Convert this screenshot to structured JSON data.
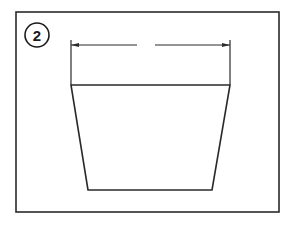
{
  "diagram": {
    "step_number": "2",
    "colors": {
      "line": "#2a2a2a",
      "background": "#ffffff"
    },
    "frame": {
      "x": 16,
      "y": 12,
      "width": 263,
      "height": 200
    },
    "step_badge": {
      "cx": 37,
      "cy": 35,
      "r": 12
    },
    "dimension_line": {
      "y": 45,
      "x_left": 71,
      "x_right": 230,
      "gap_start": 137,
      "gap_end": 155
    },
    "trapezoid": {
      "top_left": [
        71,
        85
      ],
      "top_right": [
        230,
        85
      ],
      "bottom_right": [
        212,
        190
      ],
      "bottom_left": [
        88,
        190
      ]
    }
  }
}
